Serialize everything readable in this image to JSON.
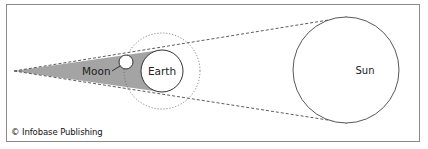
{
  "diagram": {
    "labels": {
      "moon": "Moon",
      "earth": "Earth",
      "sun": "Sun"
    },
    "credit": "© Infobase Publishing",
    "colors": {
      "shadow": "#9a9a9a",
      "outline": "#333333",
      "frame": "#8a8a8a",
      "background": "#ffffff"
    }
  }
}
